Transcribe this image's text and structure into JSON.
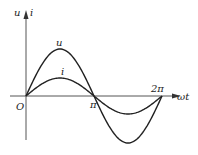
{
  "diagram": {
    "title": "",
    "labels": {
      "y_axis": "u",
      "y_axis_second": "i",
      "x_axis": "ωt",
      "origin": "O",
      "pi": "π",
      "two_pi": "2π",
      "curve_u": "u",
      "curve_i": "i"
    },
    "curves": [
      {
        "name": "u",
        "type": "sine",
        "amplitude_px": 47,
        "phase": 0,
        "period": "2π"
      },
      {
        "name": "i",
        "type": "sine",
        "amplitude_px": 18,
        "phase": 0,
        "period": "2π"
      }
    ],
    "colors": {
      "stroke": "#222222",
      "axis": "#333333"
    }
  }
}
